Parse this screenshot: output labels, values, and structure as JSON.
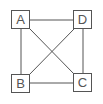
{
  "diagram": {
    "type": "graph",
    "line_color": "#555555",
    "nodes": [
      {
        "id": "A",
        "label": "A",
        "x": 11,
        "y": 10
      },
      {
        "id": "D",
        "label": "D",
        "x": 73,
        "y": 10
      },
      {
        "id": "B",
        "label": "B",
        "x": 11,
        "y": 74
      },
      {
        "id": "C",
        "label": "C",
        "x": 73,
        "y": 73
      }
    ],
    "edges": [
      {
        "from": "A",
        "to": "D"
      },
      {
        "from": "A",
        "to": "B"
      },
      {
        "from": "D",
        "to": "C"
      },
      {
        "from": "B",
        "to": "C"
      },
      {
        "from": "A",
        "to": "C"
      },
      {
        "from": "D",
        "to": "B"
      }
    ]
  }
}
